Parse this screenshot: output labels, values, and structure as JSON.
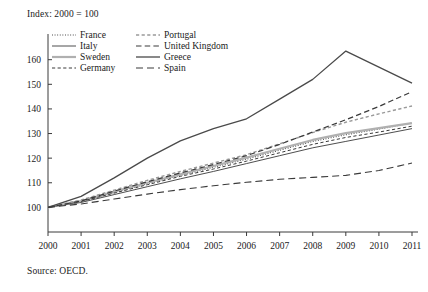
{
  "chart_data": {
    "type": "line",
    "title": "",
    "note": "Index: 2000 = 100",
    "source": "Source: OECD.",
    "xlabel": "",
    "ylabel": "",
    "grid": false,
    "legend_position": "top-left-inside",
    "x": [
      2000,
      2001,
      2002,
      2003,
      2004,
      2005,
      2006,
      2007,
      2008,
      2009,
      2010,
      2011
    ],
    "xtick_labels": [
      "2000",
      "2001",
      "2002",
      "2003",
      "2004",
      "2005",
      "2006",
      "2007",
      "2008",
      "2009",
      "2010",
      "2011"
    ],
    "ytick_labels": [
      "100",
      "110",
      "120",
      "130",
      "140",
      "150",
      "160"
    ],
    "yticks": [
      100,
      110,
      120,
      130,
      140,
      150,
      160
    ],
    "ylim": [
      90,
      168
    ],
    "xlim": [
      2000,
      2011
    ],
    "series": [
      {
        "name": "France",
        "style": "dotted",
        "color": "#3a3a3a",
        "width": 1.1,
        "values": [
          100,
          102.3,
          106.0,
          109.6,
          113.0,
          116.3,
          119.6,
          123.2,
          126.8,
          129.5,
          131.8,
          134.3
        ]
      },
      {
        "name": "Italy",
        "style": "solid",
        "color": "#3a3a3a",
        "width": 0.9,
        "values": [
          100,
          102.0,
          105.2,
          108.4,
          111.6,
          114.6,
          117.8,
          121.0,
          124.2,
          126.8,
          129.4,
          132.0
        ]
      },
      {
        "name": "Sweden",
        "style": "solid",
        "color": "#b0b0b0",
        "width": 2.2,
        "values": [
          100,
          102.6,
          106.4,
          110.0,
          113.4,
          116.8,
          120.2,
          123.8,
          127.4,
          130.2,
          132.2,
          134.2
        ]
      },
      {
        "name": "Germany",
        "style": "dashed",
        "color": "#3a3a3a",
        "width": 1.0,
        "values": [
          100,
          102.4,
          105.8,
          109.2,
          112.6,
          115.6,
          118.8,
          122.2,
          125.6,
          128.4,
          130.6,
          133.0
        ]
      },
      {
        "name": "Portugal",
        "style": "dashed",
        "color": "#9a9a9a",
        "width": 1.4,
        "values": [
          100,
          103.0,
          107.0,
          111.0,
          114.6,
          118.0,
          121.4,
          125.8,
          130.4,
          134.6,
          138.0,
          141.2
        ]
      },
      {
        "name": "United Kingdom",
        "style": "longdash",
        "color": "#3a3a3a",
        "width": 1.2,
        "values": [
          100,
          102.6,
          106.6,
          110.4,
          114.0,
          117.4,
          121.0,
          125.6,
          130.6,
          135.6,
          141.0,
          147.0
        ]
      },
      {
        "name": "Greece",
        "style": "solid",
        "color": "#4a4a4a",
        "width": 1.3,
        "values": [
          100,
          104.5,
          112.0,
          120.0,
          127.0,
          132.0,
          136.0,
          144.0,
          152.0,
          163.5,
          157.0,
          150.5
        ]
      },
      {
        "name": "Spain",
        "style": "dashed-long",
        "color": "#3a3a3a",
        "width": 1.1,
        "values": [
          100,
          101.4,
          103.4,
          105.4,
          107.2,
          108.8,
          110.2,
          111.4,
          112.2,
          113.0,
          115.0,
          118.0
        ]
      }
    ]
  },
  "legend": {
    "columns": [
      [
        {
          "label": "France"
        },
        {
          "label": "Italy"
        },
        {
          "label": "Sweden"
        },
        {
          "label": "Germany"
        }
      ],
      [
        {
          "label": "Portugal"
        },
        {
          "label": "United Kingdom"
        },
        {
          "label": "Greece"
        },
        {
          "label": "Spain"
        }
      ]
    ]
  }
}
